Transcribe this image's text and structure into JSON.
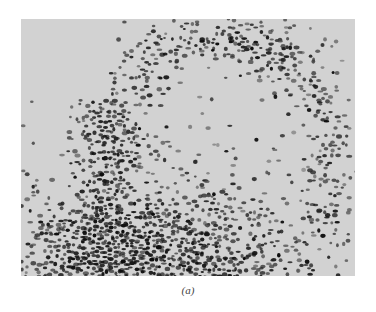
{
  "figure": {
    "caption": "(a)",
    "background_color": "#d2d2d2",
    "dot_color": "#111111"
  }
}
